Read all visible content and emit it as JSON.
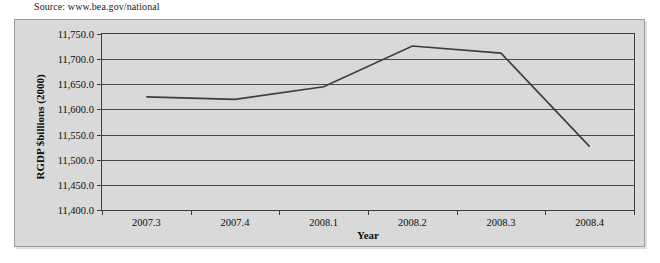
{
  "source_note": "Source: www.bea.gov/national",
  "chart_data": {
    "type": "line",
    "title": "",
    "xlabel": "Year",
    "ylabel": "RGDP $billions (2000)",
    "categories": [
      "2007.3",
      "2007.4",
      "2008.1",
      "2008.2",
      "2008.3",
      "2008.4"
    ],
    "series": [
      {
        "name": "RGDP",
        "values": [
          11625.0,
          11620.0,
          11645.0,
          11726.0,
          11712.0,
          11526.0
        ]
      }
    ],
    "ylim": [
      11400.0,
      11750.0
    ],
    "ytick_values": [
      11750.0,
      11700.0,
      11650.0,
      11600.0,
      11550.0,
      11500.0,
      11450.0,
      11400.0
    ],
    "ytick_labels": [
      "11,750.0",
      "11,700.0",
      "11,650.0",
      "11,600.0",
      "11,550.0",
      "11,500.0",
      "11,450.0",
      "11,400.0"
    ],
    "grid": true,
    "legend": false,
    "legend_position": "none",
    "markers": false,
    "line_color": "#3d3d3d",
    "plot_background": "#d9d9d9",
    "frame_background": "#d9d9d9",
    "axis_color": "#3d3d3d"
  }
}
